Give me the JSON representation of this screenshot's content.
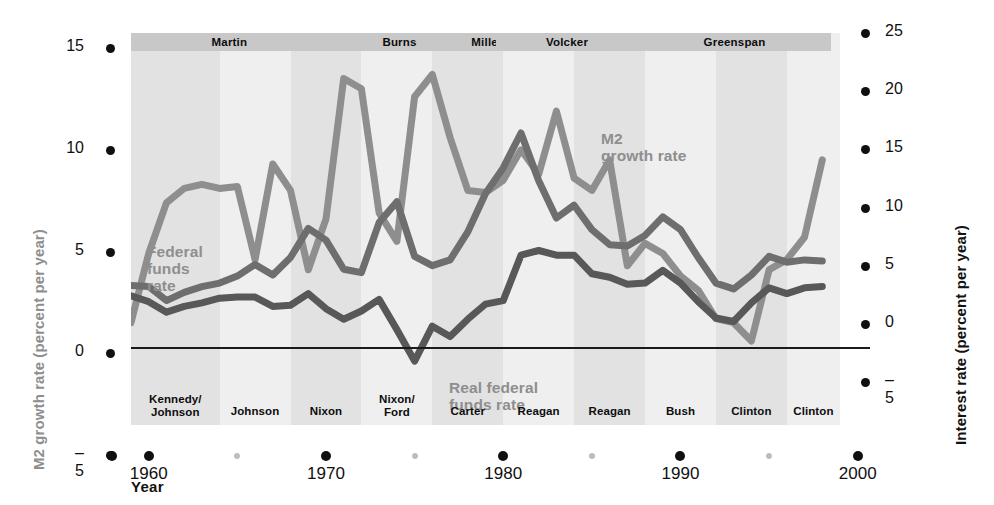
{
  "figure": {
    "x_axis_title": "Year",
    "y_axis_left_title": "M2 growth rate (percent per year)",
    "y_axis_right_title": "Interest rate (percent per year)"
  },
  "colors": {
    "m2_line": "#8e8e8e",
    "funds_line": "#6e6e6e",
    "real_funds_line": "#585858",
    "zero_line": "#1a1a1a",
    "band_dark": "#e2e2e2",
    "band_light": "#efefef",
    "chair_strip": "#c8c8c8",
    "tick_dot": "#101010",
    "tick_dot_minor": "#bdbdbd"
  },
  "axes": {
    "left_ticks": [
      "15",
      "10",
      "5",
      "0",
      "-5"
    ],
    "right_ticks": [
      "25",
      "20",
      "15",
      "10",
      "5",
      "0",
      "-5"
    ],
    "x_ticks": [
      "1960",
      "1970",
      "1980",
      "1990",
      "2000"
    ],
    "x_minor_ticks": [
      "1965",
      "1975",
      "1985",
      "1995"
    ]
  },
  "annotations": [
    {
      "name": "m2-label",
      "line1": "M2",
      "line2": "growth rate"
    },
    {
      "name": "federal-funds-label",
      "line1": "Federal",
      "line2": "funds",
      "line3": "rate"
    },
    {
      "name": "real-federal-funds-label",
      "line1": "Real federal",
      "line2": "funds rate"
    }
  ],
  "fed_chairs": [
    {
      "label": "Martin",
      "start": 1959.0,
      "end": 1970.1
    },
    {
      "label": "Burns",
      "start": 1970.1,
      "end": 1978.2
    },
    {
      "label": "Miller",
      "start": 1978.2,
      "end": 1979.6
    },
    {
      "label": "Volcker",
      "start": 1979.6,
      "end": 1987.6
    },
    {
      "label": "Greenspan",
      "start": 1987.6,
      "end": 1998.5
    }
  ],
  "presidents": [
    {
      "label": "Kennedy/\nJohnson",
      "start": 1959.0,
      "end": 1964.0
    },
    {
      "label": "Johnson",
      "start": 1964.0,
      "end": 1968.0
    },
    {
      "label": "Nixon",
      "start": 1968.0,
      "end": 1972.0
    },
    {
      "label": "Nixon/\nFord",
      "start": 1972.0,
      "end": 1976.0
    },
    {
      "label": "Carter",
      "start": 1976.0,
      "end": 1980.0
    },
    {
      "label": "Reagan",
      "start": 1980.0,
      "end": 1984.0
    },
    {
      "label": "Reagan",
      "start": 1984.0,
      "end": 1988.0
    },
    {
      "label": "Bush",
      "start": 1988.0,
      "end": 1992.0
    },
    {
      "label": "Clinton",
      "start": 1992.0,
      "end": 1996.0
    },
    {
      "label": "Clinton",
      "start": 1996.0,
      "end": 1999.0
    }
  ],
  "chart_data": {
    "type": "line",
    "title": "",
    "xlabel": "Year",
    "ylabel": "M2 growth rate (percent per year)",
    "ylabel_right": "Interest rate (percent per year)",
    "xlim": [
      1959,
      1999
    ],
    "ylim_left": [
      -5,
      15
    ],
    "ylim_right": [
      -5,
      25
    ],
    "grid": false,
    "legend": "in-plot annotations",
    "x": [
      1959,
      1960,
      1961,
      1962,
      1963,
      1964,
      1965,
      1966,
      1967,
      1968,
      1969,
      1970,
      1971,
      1972,
      1973,
      1974,
      1975,
      1976,
      1977,
      1978,
      1979,
      1980,
      1981,
      1982,
      1983,
      1984,
      1985,
      1986,
      1987,
      1988,
      1989,
      1990,
      1991,
      1992,
      1993,
      1994,
      1995,
      1996,
      1997,
      1998
    ],
    "series": [
      {
        "name": "M2 growth rate",
        "axis": "left",
        "color": "#8e8e8e",
        "values": [
          1.5,
          4.9,
          7.4,
          8.1,
          8.3,
          8.1,
          8.2,
          4.6,
          9.3,
          8.0,
          4.1,
          6.6,
          13.5,
          13.0,
          6.9,
          5.5,
          12.6,
          13.7,
          10.6,
          8.0,
          7.9,
          8.5,
          10.0,
          8.8,
          11.9,
          8.6,
          8.0,
          9.5,
          4.3,
          5.4,
          4.9,
          3.8,
          3.1,
          1.7,
          1.5,
          0.6,
          4.1,
          4.6,
          5.7,
          9.5
        ]
      },
      {
        "name": "Federal funds rate",
        "axis": "right",
        "color": "#6e6e6e",
        "values": [
          3.3,
          3.2,
          2.0,
          2.7,
          3.2,
          3.5,
          4.1,
          5.1,
          4.2,
          5.7,
          8.2,
          7.2,
          4.7,
          4.4,
          8.7,
          10.5,
          5.8,
          5.0,
          5.5,
          7.9,
          11.2,
          13.4,
          16.4,
          12.3,
          9.1,
          10.2,
          8.1,
          6.8,
          6.7,
          7.6,
          9.2,
          8.1,
          5.7,
          3.5,
          3.0,
          4.2,
          5.8,
          5.3,
          5.5,
          5.4
        ]
      },
      {
        "name": "Real federal funds rate",
        "axis": "right",
        "color": "#585858",
        "values": [
          2.4,
          1.9,
          1.0,
          1.5,
          1.8,
          2.2,
          2.3,
          2.3,
          1.5,
          1.6,
          2.6,
          1.3,
          0.4,
          1.1,
          2.1,
          -0.5,
          -3.2,
          -0.2,
          -1.1,
          0.4,
          1.7,
          2.0,
          5.9,
          6.3,
          5.9,
          5.9,
          4.3,
          4.0,
          3.4,
          3.5,
          4.6,
          3.5,
          1.9,
          0.5,
          0.2,
          1.8,
          3.1,
          2.6,
          3.1,
          3.2
        ]
      }
    ]
  }
}
